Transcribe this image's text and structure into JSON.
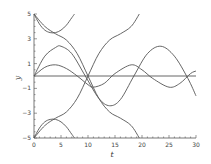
{
  "chart_data": {
    "type": "line",
    "title": "",
    "xlabel": "t",
    "ylabel": "y",
    "xlim": [
      0,
      30
    ],
    "ylim": [
      -5,
      5
    ],
    "xticks": [
      0,
      5,
      10,
      15,
      20,
      25,
      30
    ],
    "yticks": [
      -5,
      -3,
      -1,
      1,
      3,
      5
    ],
    "xtick_labels": [
      "0",
      "5",
      "10",
      "15",
      "20",
      "25",
      "30"
    ],
    "ytick_labels": [
      "-5",
      "-3",
      "-1",
      "1",
      "3",
      "5"
    ],
    "grid": false,
    "legend": null,
    "line_color": "#555555",
    "series": [
      {
        "name": "upper-arc",
        "x": [
          0,
          1,
          2,
          3,
          4,
          5,
          6,
          7,
          7.5
        ],
        "y": [
          5,
          4.2,
          3.7,
          3.5,
          3.5,
          3.7,
          4.1,
          4.7,
          5
        ]
      },
      {
        "name": "lower-arc",
        "x": [
          0,
          1,
          2,
          3,
          4,
          5,
          6,
          7,
          7.5
        ],
        "y": [
          -5,
          -4.2,
          -3.7,
          -3.5,
          -3.5,
          -3.7,
          -4.1,
          -4.7,
          -5
        ]
      },
      {
        "name": "descending-s",
        "x": [
          0,
          2,
          4,
          6,
          8,
          10,
          12,
          14,
          16,
          18,
          19.5
        ],
        "y": [
          5,
          4.0,
          3.4,
          2.9,
          1.8,
          0,
          -1.8,
          -2.9,
          -3.4,
          -4.0,
          -5
        ]
      },
      {
        "name": "ascending-s",
        "x": [
          0,
          2,
          4,
          6,
          8,
          10,
          12,
          14,
          16,
          18,
          19.5
        ],
        "y": [
          -5,
          -4.0,
          -3.4,
          -2.9,
          -1.8,
          0,
          1.8,
          2.9,
          3.4,
          4.0,
          5
        ]
      },
      {
        "name": "large-oscillation",
        "x": [
          0,
          2,
          4,
          5,
          7,
          9.5,
          12,
          14,
          16,
          18.5,
          21,
          23.5,
          26,
          28.5,
          30
        ],
        "y": [
          0,
          1.6,
          2.3,
          2.4,
          1.8,
          0,
          -1.8,
          -2.4,
          -1.9,
          0,
          1.8,
          2.4,
          1.6,
          -0.2,
          -1.6
        ]
      },
      {
        "name": "small-oscillation",
        "x": [
          0,
          2,
          4,
          6,
          8,
          10,
          11,
          13,
          15,
          18,
          20,
          22,
          25,
          27,
          29,
          30
        ],
        "y": [
          0,
          0.7,
          0.9,
          0.6,
          0,
          -0.7,
          -0.9,
          -0.6,
          0.2,
          0.9,
          0.5,
          -0.2,
          -0.9,
          -0.6,
          0.2,
          0.4
        ]
      },
      {
        "name": "zero-line",
        "x": [
          0,
          30
        ],
        "y": [
          0,
          0
        ]
      }
    ]
  }
}
